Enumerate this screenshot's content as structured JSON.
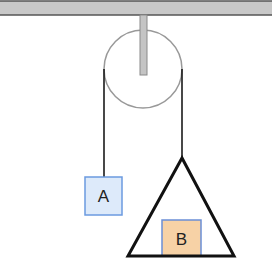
{
  "diagram": {
    "type": "pulley-system",
    "ceiling": {
      "color": "#c8c8c8",
      "border": "#555555"
    },
    "pulley": {
      "stroke": "#999999"
    },
    "rod": {
      "color": "#c4c4c4",
      "border": "#8a8a8a"
    },
    "rope_color": "#1a1a1a",
    "block_a": {
      "label": "A",
      "fill": "#ddeafa",
      "stroke": "#6b9ae0"
    },
    "pan": {
      "stroke": "#111111"
    },
    "block_b": {
      "label": "B",
      "fill": "#f7d2a6",
      "stroke": "#6b8fd6"
    }
  }
}
